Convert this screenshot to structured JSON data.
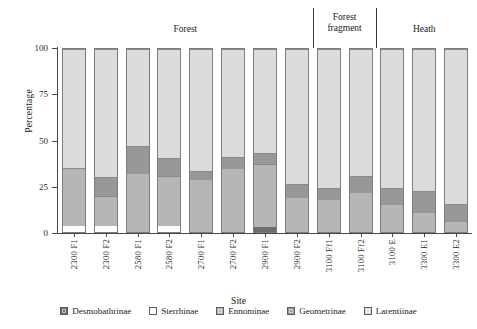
{
  "chart_data": {
    "type": "bar",
    "subtype": "stacked-percentage-bar",
    "title": "",
    "xlabel": "Site",
    "ylabel": "Percentage",
    "ylim": [
      0,
      100
    ],
    "yticks": [
      0,
      25,
      50,
      75,
      100
    ],
    "ytick_labels": [
      "0",
      "25",
      "50",
      "75",
      "100"
    ],
    "grid": false,
    "legend_position": "bottom",
    "categories": [
      "2300 F1",
      "2300 F2",
      "2580 F1",
      "2580 F2",
      "2700 F1",
      "2700 F2",
      "2900 F1",
      "2900 F2",
      "3100 Ff1",
      "3100 Ff2",
      "3100 E",
      "3300 E1",
      "3300 E2"
    ],
    "series": [
      {
        "name": "Desmobathrinae",
        "color": "#6d6d6d",
        "values": [
          0,
          0,
          0,
          0,
          0,
          0,
          3,
          0,
          0,
          0,
          0,
          0,
          0
        ]
      },
      {
        "name": "Sterrhinae",
        "color": "#ffffff",
        "values": [
          3.5,
          3.5,
          0,
          3.5,
          0,
          0,
          0,
          0,
          0,
          0,
          0,
          0,
          0
        ]
      },
      {
        "name": "Ennominae",
        "color": "#b6b6b6",
        "values": [
          31.5,
          16,
          32,
          27,
          29,
          35,
          34,
          19,
          17.5,
          21.5,
          15,
          10.5,
          5.5
        ]
      },
      {
        "name": "Geometrinae",
        "color": "#989898",
        "values": [
          0,
          10,
          15,
          9.5,
          4,
          6,
          6,
          7,
          6.5,
          9,
          9,
          11.5,
          9.5
        ]
      },
      {
        "name": "Larentiinae",
        "color": "#dcdcdc",
        "values": [
          65,
          70.5,
          53,
          60,
          67,
          59,
          57,
          74,
          76,
          69.5,
          76,
          78,
          85
        ]
      }
    ],
    "groups": [
      {
        "label": "Forest",
        "start_index": 0,
        "end_index": 7
      },
      {
        "label": "Forest\nfragment",
        "start_index": 8,
        "end_index": 9
      },
      {
        "label": "Heath",
        "start_index": 10,
        "end_index": 12
      }
    ]
  },
  "legend": {
    "items": [
      {
        "label": "Desmobathrinae",
        "color": "#6d6d6d"
      },
      {
        "label": "Sterrhinae",
        "color": "#ffffff"
      },
      {
        "label": "Ennominae",
        "color": "#b6b6b6"
      },
      {
        "label": "Geometrinae",
        "color": "#989898"
      },
      {
        "label": "Larentiinae",
        "color": "#dcdcdc"
      }
    ]
  },
  "axes": {
    "y_title": "Percentage",
    "x_title": "Site"
  },
  "colors": {
    "axis": "#4a4a4a",
    "text": "#1a1a1a",
    "bar_border": "#7d7d7d",
    "separator": "#3a3a3a",
    "background": "#ffffff"
  }
}
